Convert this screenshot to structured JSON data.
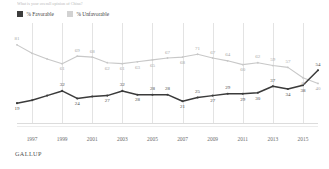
{
  "question_fragment": "What is your overall opinion of China?",
  "legend": {
    "items": [
      {
        "label": "% Favorable",
        "color": "#3d3d3d",
        "key": "favorable"
      },
      {
        "label": "% Unfavorable",
        "color": "#d2d2d2",
        "key": "unfavorable"
      }
    ]
  },
  "footer": {
    "source": "GALLUP"
  },
  "axis": {
    "xticks": [
      "1997",
      "1999",
      "2001",
      "2003",
      "2005",
      "2007",
      "2009",
      "2011",
      "2013",
      "2015"
    ]
  },
  "chart_data": {
    "type": "line",
    "title": "",
    "subtitle": "",
    "xlabel": "",
    "ylabel": "",
    "xlim": [
      1996,
      2016
    ],
    "ylim": [
      0,
      100
    ],
    "grid": true,
    "legend_position": "top-left",
    "x": [
      1996,
      1997,
      1998,
      1999,
      2000,
      2001,
      2002,
      2003,
      2004,
      2005,
      2006,
      2007,
      2008,
      2009,
      2010,
      2011,
      2012,
      2013,
      2014,
      2015,
      2016
    ],
    "series": [
      {
        "name": "% Unfavorable",
        "color": "#c8c8c8",
        "values": [
          81,
          72,
          66,
          61,
          69,
          68,
          62,
          61,
          63,
          65,
          67,
          68,
          71,
          67,
          64,
          60,
          62,
          59,
          57,
          46,
          40
        ],
        "labels": [
          81,
          null,
          null,
          61,
          69,
          68,
          62,
          61,
          63,
          65,
          67,
          68,
          71,
          67,
          64,
          60,
          62,
          59,
          57,
          46,
          40
        ],
        "label_positions": [
          "above",
          null,
          null,
          "below",
          "above",
          "above",
          "below",
          "below",
          "below",
          "below",
          "above",
          "below",
          "above",
          "above",
          "above",
          "below",
          "above",
          "above",
          "above",
          "below",
          "below"
        ]
      },
      {
        "name": "% Favorable",
        "color": "#3b3b3b",
        "values": [
          19,
          22,
          27,
          32,
          24,
          26,
          27,
          32,
          28,
          28,
          28,
          21,
          25,
          27,
          29,
          29,
          30,
          37,
          34,
          38,
          54
        ],
        "labels": [
          19,
          null,
          null,
          32,
          24,
          null,
          27,
          32,
          28,
          28,
          28,
          21,
          25,
          27,
          29,
          29,
          30,
          37,
          34,
          38,
          54
        ],
        "label_positions": [
          "below",
          null,
          null,
          "above",
          "below",
          null,
          "below",
          "above",
          "below",
          "above",
          "above",
          "below",
          "above",
          "below",
          "above",
          "below",
          "below",
          "above",
          "below",
          "below",
          "above"
        ]
      }
    ],
    "crossover_note": "Favorable (54) overtakes Unfavorable (40) in final year"
  }
}
